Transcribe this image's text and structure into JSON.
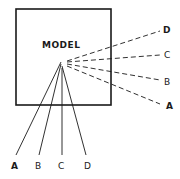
{
  "diagram": {
    "box_label": "MODEL",
    "bottom_rays": [
      {
        "label": "A",
        "style": "solid"
      },
      {
        "label": "B",
        "style": "solid"
      },
      {
        "label": "C",
        "style": "solid"
      },
      {
        "label": "D",
        "style": "solid"
      }
    ],
    "right_rays": [
      {
        "label": "D",
        "style": "dashed"
      },
      {
        "label": "C",
        "style": "dashed"
      },
      {
        "label": "B",
        "style": "dashed"
      },
      {
        "label": "A",
        "style": "dashed"
      }
    ],
    "colors": {
      "ink": "#1a1a1a",
      "background": "#ffffff"
    }
  }
}
